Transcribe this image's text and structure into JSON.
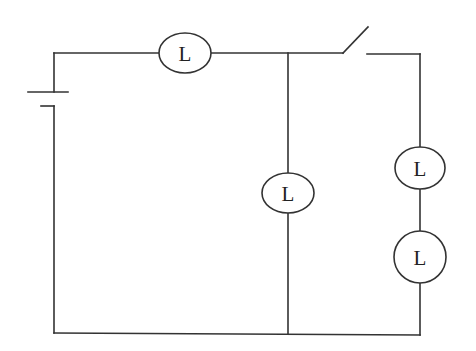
{
  "diagram": {
    "type": "electric-circuit",
    "colors": {
      "line": "#333333",
      "background": "#ffffff",
      "text": "#222222"
    },
    "components": {
      "battery": {
        "label": ""
      },
      "switch": {
        "state": "open",
        "label": ""
      },
      "lamps": [
        {
          "id": "lamp-top",
          "label": "L",
          "position": "top wire, series with battery"
        },
        {
          "id": "lamp-middle",
          "label": "L",
          "position": "middle parallel branch"
        },
        {
          "id": "lamp-right-upper",
          "label": "L",
          "position": "right branch, upper"
        },
        {
          "id": "lamp-right-lower",
          "label": "L",
          "position": "right branch, lower"
        }
      ]
    }
  }
}
